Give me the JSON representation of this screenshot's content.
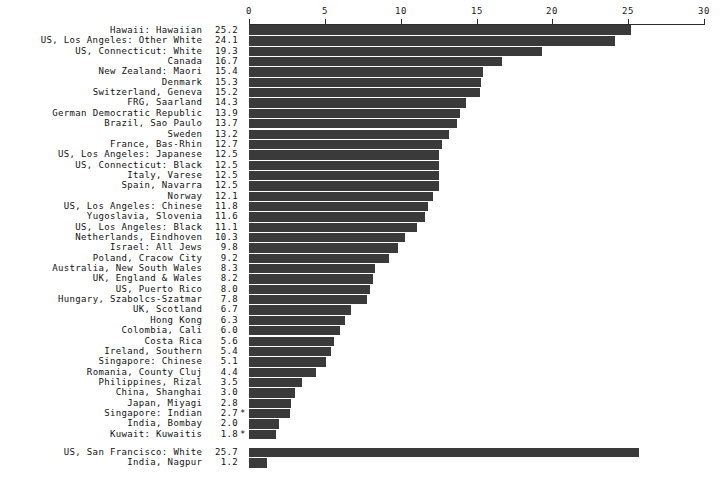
{
  "chart_data": {
    "type": "bar",
    "orientation": "horizontal",
    "title": "",
    "subtitle": "",
    "xlabel": "",
    "ylabel": "",
    "xlim": [
      0,
      30
    ],
    "xticks": [
      0,
      5,
      10,
      15,
      20,
      25,
      30
    ],
    "xtick_labels": [
      "0",
      "5",
      "10",
      "15",
      "20",
      "25",
      "30"
    ],
    "grid": false,
    "legend": null,
    "bar_color": "#3a3a3a",
    "axis_color": "#2b2b2b",
    "background_color": "#ffffff",
    "footnote_marker": "*",
    "categories": [
      "Hawaii: Hawaiian",
      "US, Los Angeles: Other White",
      "US, Connecticut: White",
      "Canada",
      "New Zealand: Maori",
      "Denmark",
      "Switzerland, Geneva",
      "FRG, Saarland",
      "German Democratic Republic",
      "Brazil, Sao Paulo",
      "Sweden",
      "France, Bas-Rhin",
      "US, Los Angeles: Japanese",
      "US, Connecticut: Black",
      "Italy, Varese",
      "Spain, Navarra",
      "Norway",
      "US, Los Angeles: Chinese",
      "Yugoslavia, Slovenia",
      "US, Los Angeles: Black",
      "Netherlands, Eindhoven",
      "Israel: All Jews",
      "Poland, Cracow City",
      "Australia, New South Wales",
      "UK, England & Wales",
      "US, Puerto Rico",
      "Hungary, Szabolcs-Szatmar",
      "UK, Scotland",
      "Hong Kong",
      "Colombia, Cali",
      "Costa Rica",
      "Ireland, Southern",
      "Singapore: Chinese",
      "Romania, County Cluj",
      "Philippines, Rizal",
      "China, Shanghai",
      "Japan, Miyagi",
      "Singapore: Indian",
      "India, Bombay",
      "Kuwait: Kuwaitis",
      "US, San Francisco: White",
      "India, Nagpur"
    ],
    "values": [
      25.2,
      24.1,
      19.3,
      16.7,
      15.4,
      15.3,
      15.2,
      14.3,
      13.9,
      13.7,
      13.2,
      12.7,
      12.5,
      12.5,
      12.5,
      12.5,
      12.1,
      11.8,
      11.6,
      11.1,
      10.3,
      9.8,
      9.2,
      8.3,
      8.2,
      8.0,
      7.8,
      6.7,
      6.3,
      6.0,
      5.6,
      5.4,
      5.1,
      4.4,
      3.5,
      3.0,
      2.8,
      2.7,
      2.0,
      1.8,
      25.7,
      1.2
    ],
    "value_labels": [
      "25.2",
      "24.1",
      "19.3",
      "16.7",
      "15.4",
      "15.3",
      "15.2",
      "14.3",
      "13.9",
      "13.7",
      "13.2",
      "12.7",
      "12.5",
      "12.5",
      "12.5",
      "12.5",
      "12.1",
      "11.8",
      "11.6",
      "11.1",
      "10.3",
      "9.8",
      "9.2",
      "8.3",
      "8.2",
      "8.0",
      "7.8",
      "6.7",
      "6.3",
      "6.0",
      "5.6",
      "5.4",
      "5.1",
      "4.4",
      "3.5",
      "3.0",
      "2.8",
      "2.7",
      "2.0",
      "1.8",
      "25.7",
      "1.2"
    ],
    "starred": [
      false,
      false,
      false,
      false,
      false,
      false,
      false,
      false,
      false,
      false,
      false,
      false,
      false,
      false,
      false,
      false,
      false,
      false,
      false,
      false,
      false,
      false,
      false,
      false,
      false,
      false,
      false,
      false,
      false,
      false,
      false,
      false,
      false,
      false,
      false,
      false,
      false,
      true,
      false,
      true,
      false,
      false
    ],
    "group_break_after_index": 39
  }
}
